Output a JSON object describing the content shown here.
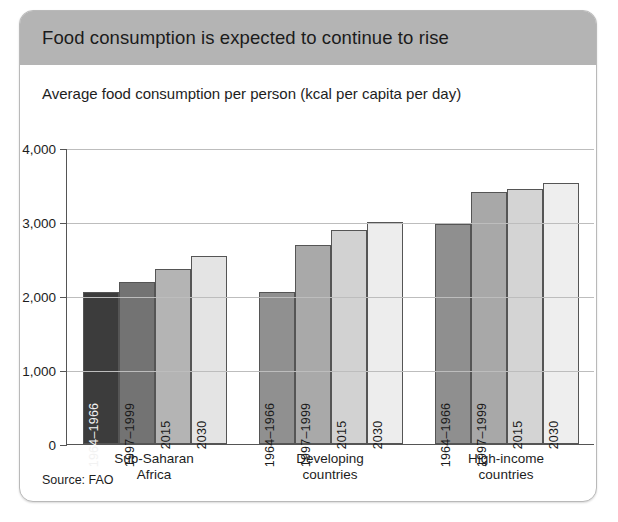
{
  "card": {
    "title": "Food consumption is expected to continue to rise",
    "subtitle": "Average food consumption per person (kcal per capita per day)",
    "source": "Source: FAO"
  },
  "chart_data": {
    "type": "bar",
    "title": "Food consumption is expected to continue to rise",
    "subtitle": "Average food consumption per person (kcal per capita per day)",
    "xlabel": "",
    "ylabel": "",
    "ylim": [
      0,
      4000
    ],
    "ytick_labels": [
      "0",
      "1,000",
      "2,000",
      "3,000",
      "4,000"
    ],
    "ytick_values": [
      0,
      1000,
      2000,
      3000,
      4000
    ],
    "grid": true,
    "legend": "none",
    "source": "Source: FAO",
    "categories": [
      "Sub-Saharan Africa",
      "Developing countries",
      "High-income countries"
    ],
    "series": [
      {
        "name": "1964–1966",
        "values": [
          2050,
          2050,
          2970
        ],
        "color": "#3c3c3c"
      },
      {
        "name": "1997–1999",
        "values": [
          2190,
          2690,
          3410
        ],
        "color": "#737373"
      },
      {
        "name": "2015",
        "values": [
          2360,
          2890,
          3450
        ],
        "color": "#b4b4b4"
      },
      {
        "name": "2030",
        "values": [
          2540,
          3000,
          3530
        ],
        "color": "#e4e4e4"
      }
    ],
    "groups": [
      {
        "category": "Sub-Saharan",
        "category_line2": "Africa",
        "bars": [
          {
            "label": "1964–1966",
            "value": 2050,
            "color": "#3c3c3c",
            "label_color": "#f2f2f2"
          },
          {
            "label": "1997–1999",
            "value": 2190,
            "color": "#737373",
            "label_color": "#1b1b1b"
          },
          {
            "label": "2015",
            "value": 2360,
            "color": "#b4b4b4",
            "label_color": "#1b1b1b"
          },
          {
            "label": "2030",
            "value": 2540,
            "color": "#e4e4e4",
            "label_color": "#1b1b1b"
          }
        ]
      },
      {
        "category": "Developing",
        "category_line2": "countries",
        "bars": [
          {
            "label": "1964–1966",
            "value": 2050,
            "color": "#909090",
            "label_color": "#1b1b1b"
          },
          {
            "label": "1997–1999",
            "value": 2690,
            "color": "#a9a9a9",
            "label_color": "#1b1b1b"
          },
          {
            "label": "2015",
            "value": 2890,
            "color": "#d2d2d2",
            "label_color": "#1b1b1b"
          },
          {
            "label": "2030",
            "value": 3000,
            "color": "#ededed",
            "label_color": "#1b1b1b"
          }
        ]
      },
      {
        "category": "High-income",
        "category_line2": "countries",
        "bars": [
          {
            "label": "1964–1966",
            "value": 2970,
            "color": "#8f8f8f",
            "label_color": "#1b1b1b"
          },
          {
            "label": "1997–1999",
            "value": 3410,
            "color": "#a8a8a8",
            "label_color": "#1b1b1b"
          },
          {
            "label": "2015",
            "value": 3450,
            "color": "#d4d4d4",
            "label_color": "#1b1b1b"
          },
          {
            "label": "2030",
            "value": 3530,
            "color": "#eeeeee",
            "label_color": "#1b1b1b"
          }
        ]
      }
    ]
  }
}
